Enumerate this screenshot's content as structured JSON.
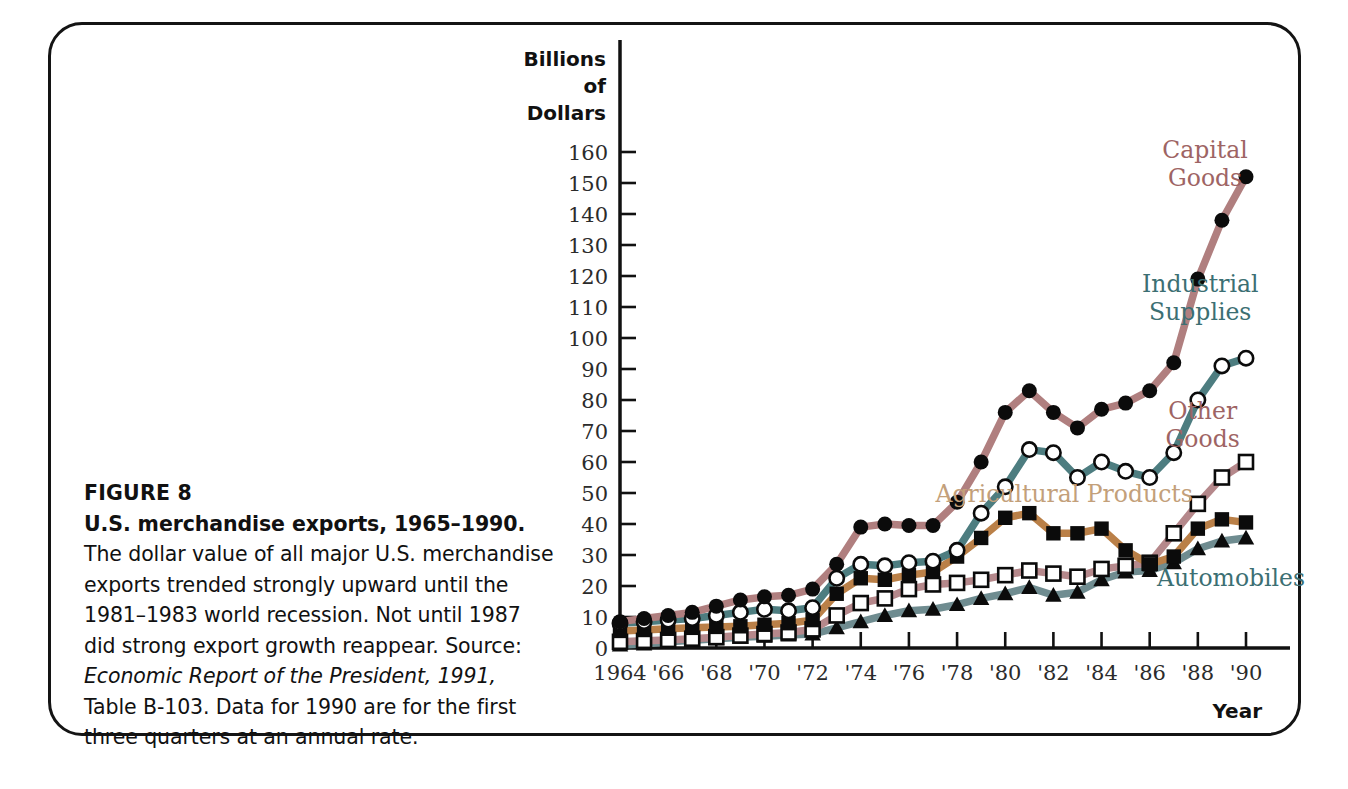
{
  "figure": {
    "number_label": "FIGURE 8",
    "title": "U.S. merchandise exports, 1965–1990.",
    "body_1": " The dollar value of all major U.S. merchandise exports trended strongly upward until the 1981–1983 world recession. Not until 1987 did strong export growth reappear. ",
    "source_prefix": "Source: ",
    "source_italic": "Economic Report of the President, 1991,",
    "source_rest": " Table B-103. Data for 1990 are for the first three quarters at an annual rate."
  },
  "chart_data": {
    "type": "line",
    "title": "U.S. merchandise exports, 1965–1990",
    "xlabel": "Year",
    "ylabel": "Billions of Dollars",
    "ylabel_lines": [
      "Billions",
      "of",
      "Dollars"
    ],
    "xlim": [
      1964,
      1990
    ],
    "ylim": [
      0,
      160
    ],
    "grid": false,
    "legend": "inline-labels",
    "y_ticks": [
      0,
      10,
      20,
      30,
      40,
      50,
      60,
      70,
      80,
      90,
      100,
      110,
      120,
      130,
      140,
      150,
      160
    ],
    "y_tick_labels": [
      "0",
      "10",
      "20",
      "30",
      "40",
      "50",
      "60",
      "70",
      "80",
      "90",
      "100",
      "110",
      "120",
      "130",
      "140",
      "150",
      "160"
    ],
    "x": [
      1964,
      1965,
      1966,
      1967,
      1968,
      1969,
      1970,
      1971,
      1972,
      1973,
      1974,
      1975,
      1976,
      1977,
      1978,
      1979,
      1980,
      1981,
      1982,
      1983,
      1984,
      1985,
      1986,
      1987,
      1988,
      1989,
      1990
    ],
    "x_ticks": [
      1964,
      1966,
      1968,
      1970,
      1972,
      1974,
      1976,
      1978,
      1980,
      1982,
      1984,
      1986,
      1988,
      1990
    ],
    "x_tick_labels": [
      "1964",
      "'66",
      "'68",
      "'70",
      "'72",
      "'74",
      "'76",
      "'78",
      "'80",
      "'82",
      "'84",
      "'86",
      "'88",
      "'90"
    ],
    "series": [
      {
        "name": "Capital Goods",
        "color": "#b07f7f",
        "label_color": "#9e6464",
        "marker": "filled-circle",
        "label_x": 1988.3,
        "label_y": 158,
        "label_lines": [
          "Capital",
          "Goods"
        ],
        "values": [
          8.5,
          9.5,
          10.5,
          11.5,
          13.5,
          15.5,
          16.5,
          17.0,
          19.0,
          27.0,
          39.0,
          40.0,
          39.5,
          39.5,
          47.0,
          60.0,
          76.0,
          83.0,
          76.0,
          71.0,
          77.0,
          79.0,
          83.0,
          92.0,
          119.0,
          138.0,
          152.0
        ]
      },
      {
        "name": "Industrial Supplies",
        "color": "#4d7d80",
        "label_color": "#3c6f73",
        "marker": "open-circle",
        "label_x": 1988.1,
        "label_y": 115,
        "label_lines": [
          "Industrial",
          "Supplies"
        ],
        "values": [
          8.0,
          8.5,
          9.0,
          9.5,
          10.5,
          11.5,
          12.5,
          12.0,
          13.0,
          22.5,
          27.0,
          26.5,
          27.5,
          28.0,
          31.5,
          43.5,
          52.0,
          64.0,
          63.0,
          55.0,
          60.0,
          57.0,
          55.0,
          63.0,
          80.0,
          91.0,
          93.5
        ]
      },
      {
        "name": "Other Goods",
        "color": "#b5888b",
        "label_color": "#9e6464",
        "marker": "open-square",
        "label_x": 1988.2,
        "label_y": 74,
        "label_lines": [
          "Other",
          "Goods"
        ],
        "values": [
          2.0,
          2.3,
          2.6,
          3.0,
          3.5,
          4.0,
          4.5,
          5.0,
          6.0,
          10.5,
          14.5,
          16.0,
          19.0,
          20.5,
          21.0,
          22.0,
          23.5,
          25.0,
          24.0,
          23.0,
          25.5,
          26.5,
          27.5,
          37.0,
          46.5,
          55.0,
          60.0
        ]
      },
      {
        "name": "Agricultural Products",
        "color": "#ba8048",
        "label_color": "#c3a07a",
        "marker": "filled-square",
        "label_x": 1977.1,
        "label_y": 47,
        "label_lines": [
          "Agricultural Products"
        ],
        "values": [
          5.5,
          5.8,
          6.2,
          6.5,
          6.8,
          7.0,
          7.5,
          8.0,
          9.0,
          17.5,
          22.5,
          22.0,
          23.5,
          24.5,
          29.5,
          35.5,
          42.0,
          43.5,
          37.0,
          37.0,
          38.5,
          31.5,
          27.0,
          29.5,
          38.5,
          41.5,
          40.5
        ]
      },
      {
        "name": "Automobiles",
        "color": "#6f8c90",
        "label_color": "#3c6f73",
        "marker": "filled-triangle",
        "label_x": 1986.3,
        "label_y": 20,
        "label_lines": [
          "Automobiles"
        ],
        "values": [
          1.0,
          1.3,
          2.0,
          2.5,
          3.0,
          3.5,
          3.8,
          4.2,
          4.5,
          6.5,
          8.5,
          10.5,
          12.0,
          12.5,
          14.0,
          16.0,
          17.5,
          19.5,
          17.0,
          18.0,
          22.0,
          24.5,
          25.0,
          27.5,
          32.0,
          34.5,
          35.5
        ]
      }
    ]
  }
}
